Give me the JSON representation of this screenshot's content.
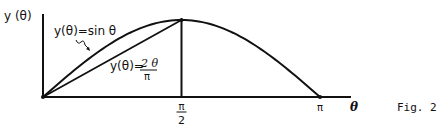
{
  "chart_data": {
    "type": "line",
    "title": "",
    "figure_label": "Fig. 2",
    "xlabel": "θ",
    "ylabel": "y (θ)",
    "xlim": [
      0,
      3.14159
    ],
    "ylim": [
      0,
      1
    ],
    "x_ticks": [
      {
        "value": 1.5708,
        "label_num": "π",
        "label_den": "2"
      },
      {
        "value": 3.14159,
        "label": "π"
      }
    ],
    "series": [
      {
        "name": "y(θ)=sin θ",
        "function": "sin",
        "domain": [
          0,
          3.14159
        ]
      },
      {
        "name": "y(θ)=2θ/π",
        "function": "linear",
        "points": [
          [
            0,
            0
          ],
          [
            1.5708,
            1
          ]
        ]
      }
    ],
    "annotations": [
      {
        "text": "y(θ)=sin θ",
        "target": "sine-curve"
      },
      {
        "text_prefix": "y(θ)=",
        "num": "2 θ",
        "den": "π",
        "target": "chord-line"
      }
    ],
    "vertical_line_at": 1.5708,
    "grid": false,
    "legend": "none"
  }
}
